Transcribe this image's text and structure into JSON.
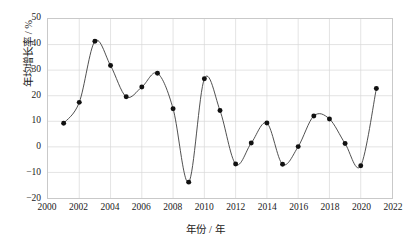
{
  "chart_data": {
    "type": "line",
    "title": "",
    "subtitle": "",
    "xlabel": "年份 / 年",
    "ylabel": "年均增长率 / %",
    "xlim": [
      2000,
      2022
    ],
    "ylim": [
      -20,
      50
    ],
    "xticks": [
      2000,
      2002,
      2004,
      2006,
      2008,
      2010,
      2012,
      2014,
      2016,
      2018,
      2020,
      2022
    ],
    "yticks": [
      -20,
      -10,
      0,
      10,
      20,
      30,
      40,
      50
    ],
    "grid": true,
    "legend": "none",
    "marker": "filled-circle",
    "line_color": "#3b3b3b",
    "marker_color": "#111111",
    "grid_color": "#d8d8d8",
    "x": [
      2001,
      2002,
      2003,
      2004,
      2005,
      2006,
      2007,
      2008,
      2009,
      2010,
      2011,
      2012,
      2013,
      2014,
      2015,
      2016,
      2017,
      2018,
      2019,
      2020,
      2021
    ],
    "values": [
      9.2,
      17.4,
      41.3,
      31.8,
      19.6,
      23.4,
      28.8,
      14.9,
      -13.8,
      26.6,
      14.2,
      -6.7,
      1.5,
      9.3,
      -6.8,
      0.1,
      12.1,
      10.9,
      1.3,
      -7.4,
      22.8
    ],
    "series": [
      {
        "name": "年均增长率",
        "values": [
          9.2,
          17.4,
          41.3,
          31.8,
          19.6,
          23.4,
          28.8,
          14.9,
          -13.8,
          26.6,
          14.2,
          -6.7,
          1.5,
          9.3,
          -6.8,
          0.1,
          12.1,
          10.9,
          1.3,
          -7.4,
          22.8
        ]
      }
    ]
  }
}
